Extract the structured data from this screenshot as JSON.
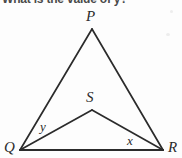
{
  "question": {
    "text": "What is the value of y?"
  },
  "figure": {
    "type": "geometry-diagram",
    "stroke_color": "#2b2b2b",
    "background_color": "#fdfdfd",
    "vertices": [
      {
        "name": "P",
        "label": "P",
        "x": 92,
        "y": 29
      },
      {
        "name": "Q",
        "label": "Q",
        "x": 20,
        "y": 150
      },
      {
        "name": "R",
        "label": "R",
        "x": 163,
        "y": 150
      },
      {
        "name": "S",
        "label": "S",
        "x": 92,
        "y": 110
      }
    ],
    "segments": [
      {
        "name": "PQ",
        "from": "P",
        "to": "Q"
      },
      {
        "name": "PR",
        "from": "P",
        "to": "R"
      },
      {
        "name": "QR",
        "from": "Q",
        "to": "R"
      },
      {
        "name": "QS",
        "from": "Q",
        "to": "S"
      },
      {
        "name": "SR",
        "from": "S",
        "to": "R"
      }
    ],
    "angle_labels": [
      {
        "name": "y",
        "label": "y",
        "at_vertex": "Q",
        "between": "QP and QS"
      },
      {
        "name": "x",
        "label": "x",
        "at_vertex": "R",
        "between": "RS and RQ"
      }
    ]
  }
}
